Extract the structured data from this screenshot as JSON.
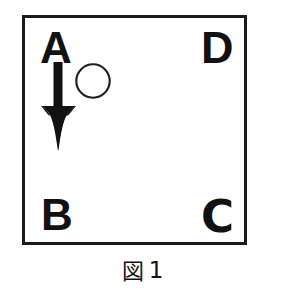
{
  "figure": {
    "caption_kanji": "図",
    "caption_number": "1",
    "frame": {
      "border_color": "#1a1a1a",
      "fill_color": "#ffffff"
    },
    "labels": [
      {
        "id": "A",
        "text": "A",
        "position": "top-left"
      },
      {
        "id": "D",
        "text": "D",
        "position": "top-right"
      },
      {
        "id": "B",
        "text": "B",
        "position": "bottom-left"
      },
      {
        "id": "C",
        "text": "C",
        "position": "bottom-right"
      }
    ],
    "shapes": [
      {
        "kind": "arrow",
        "direction": "down",
        "color": "#111111",
        "name": "down-arrow-icon"
      },
      {
        "kind": "circle",
        "filled": false,
        "stroke_color": "#1a1a1a",
        "name": "circle-outline-icon"
      }
    ]
  }
}
